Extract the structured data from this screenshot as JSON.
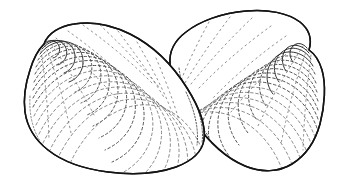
{
  "figure": {
    "kind": "scientific-line-illustration",
    "canvas": {
      "width": 344,
      "height": 196
    },
    "background_color": "#ffffff",
    "outline_color": "#141414",
    "growth_line_color": "#4a4a4a",
    "fine_line_color": "#6d6d6d",
    "technique": "stippled concentric growth lines with solid outline",
    "caption": ""
  },
  "specimens": [
    {
      "id": "left-valve",
      "label": "Left valve (foreground)",
      "depth_order": "front",
      "umbo_position": {
        "x": 44,
        "y": 44
      },
      "bounding_box": {
        "x": 24,
        "y": 22,
        "width": 185,
        "height": 152
      },
      "growth_rings": 14,
      "outline_path": "M 44 44 C 48 33, 60 26, 74 24 C 92 21, 112 25, 130 34 C 152 45, 172 64, 187 88 C 199 107, 206 126, 204 140 C 202 152, 192 161, 176 167 C 156 174, 131 175, 108 172 C 84 169, 62 161, 48 150 C 34 139, 27 126, 25 112 C 23 97, 26 82, 30 70 C 33 60, 37 51, 44 44 Z"
    },
    {
      "id": "right-valve",
      "label": "Right valve (background)",
      "depth_order": "back",
      "umbo_position": {
        "x": 309,
        "y": 50
      },
      "bounding_box": {
        "x": 168,
        "y": 10,
        "width": 158,
        "height": 162
      },
      "growth_rings": 14,
      "outline_path": "M 309 50 C 312 40, 310 30, 300 22 C 288 13, 268 9, 246 11 C 222 13, 200 21, 186 32 C 174 41, 169 52, 170 64 C 171 80, 180 100, 194 121 C 208 141, 226 158, 245 166 C 262 173, 279 172, 292 164 C 305 156, 315 142, 320 124 C 325 105, 326 84, 322 70 C 319 60, 315 54, 309 50 Z"
    }
  ]
}
